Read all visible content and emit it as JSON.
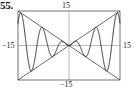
{
  "figure": {
    "problem_number": "55.",
    "labels": {
      "top": "15",
      "left": "−15",
      "right": "15",
      "bottom": "−15"
    }
  },
  "chart_data": {
    "type": "line",
    "title": "",
    "subtitle": "",
    "xlabel": "",
    "ylabel": "",
    "function": "y = x sin(x)",
    "xlim": [
      -15,
      15
    ],
    "ylim": [
      -15,
      15
    ],
    "grid": false,
    "axes_shown": true,
    "legend": null,
    "tick_labels": {
      "x": [
        "−15",
        "15"
      ],
      "y": [
        "−15",
        "15"
      ]
    },
    "annotations": [
      {
        "text": "15",
        "position": "top",
        "axis": "y",
        "value": 15
      },
      {
        "text": "−15",
        "position": "bottom",
        "axis": "y",
        "value": -15
      },
      {
        "text": "−15",
        "position": "left",
        "axis": "x",
        "value": -15
      },
      {
        "text": "15",
        "position": "right",
        "axis": "x",
        "value": 15
      }
    ],
    "series": [
      {
        "name": "y = x sin(x)",
        "color": "#1a1a1a",
        "x": [
          -15,
          -14.7,
          -14.4,
          -14.1,
          -13.8,
          -13.5,
          -13.2,
          -12.9,
          -12.6,
          -12.3,
          -12,
          -11.7,
          -11.4,
          -11.1,
          -10.8,
          -10.5,
          -10.2,
          -9.9,
          -9.6,
          -9.3,
          -9,
          -8.7,
          -8.4,
          -8.1,
          -7.8,
          -7.5,
          -7.2,
          -6.9,
          -6.6,
          -6.3,
          -6,
          -5.7,
          -5.4,
          -5.1,
          -4.8,
          -4.5,
          -4.2,
          -3.9,
          -3.6,
          -3.3,
          -3,
          -2.7,
          -2.4,
          -2.1,
          -1.8,
          -1.5,
          -1.2,
          -0.9,
          -0.6,
          -0.3,
          0,
          0.3,
          0.6,
          0.9,
          1.2,
          1.5,
          1.8,
          2.1,
          2.4,
          2.7,
          3,
          3.3,
          3.6,
          3.9,
          4.2,
          4.5,
          4.8,
          5.1,
          5.4,
          5.7,
          6,
          6.3,
          6.6,
          6.9,
          7.2,
          7.5,
          7.8,
          8.1,
          8.4,
          8.7,
          9,
          9.3,
          9.6,
          9.9,
          10.2,
          10.5,
          10.8,
          11.1,
          11.4,
          11.7,
          12,
          12.3,
          12.6,
          12.9,
          13.2,
          13.5,
          13.8,
          14.1,
          14.4,
          14.7,
          15
        ],
        "y": [
          9.76,
          12.44,
          14.18,
          14.04,
          12.09,
          8.74,
          4.61,
          0.41,
          -3.29,
          -6.11,
          -6.44,
          -6.19,
          -3.99,
          -1.04,
          1.11,
          5.28,
          8.47,
          10.82,
          11.05,
          9.18,
          3.71,
          -5.46,
          -7.08,
          -8.04,
          -7.78,
          -7.04,
          -5.98,
          -4.26,
          -2.0,
          0.84,
          1.68,
          3.17,
          4.19,
          4.74,
          4.76,
          4.4,
          3.67,
          2.66,
          1.61,
          0.52,
          -0.42,
          -1.16,
          -1.62,
          -1.81,
          -1.75,
          -1.5,
          -1.12,
          -0.71,
          -0.34,
          -0.09,
          0,
          -0.09,
          -0.34,
          -0.71,
          -1.12,
          -1.5,
          -1.75,
          -1.81,
          -1.62,
          -1.16,
          -0.42,
          0.52,
          1.61,
          2.66,
          3.67,
          4.4,
          4.76,
          4.74,
          4.19,
          3.17,
          1.68,
          0.84,
          -2.0,
          -4.26,
          -5.98,
          -7.04,
          -7.78,
          -8.04,
          -7.08,
          -5.46,
          3.71,
          9.18,
          11.05,
          10.82,
          8.47,
          5.28,
          1.11,
          -1.04,
          -3.99,
          -6.19,
          -6.44,
          -6.11,
          -3.29,
          0.41,
          4.61,
          8.74,
          12.09,
          14.04,
          14.18,
          12.44,
          9.76
        ]
      },
      {
        "name": "envelope y = x",
        "color": "#1a1a1a",
        "x": [
          -15,
          15
        ],
        "y": [
          -15,
          15
        ]
      },
      {
        "name": "envelope y = -x",
        "color": "#1a1a1a",
        "x": [
          -15,
          15
        ],
        "y": [
          15,
          -15
        ]
      }
    ]
  }
}
